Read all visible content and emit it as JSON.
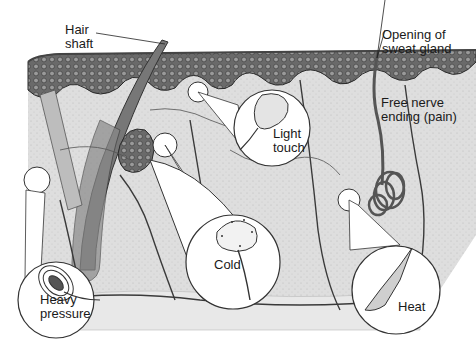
{
  "diagram": {
    "type": "anatomical illustration",
    "labels": {
      "hair_shaft": "Hair\nshaft",
      "sweat_gland": "Opening of\nsweat gland",
      "free_nerve": "Free nerve\nending (pain)",
      "light_touch": "Light\ntouch",
      "cold": "Cold",
      "heavy_pressure": "Heavy\npressure",
      "heat": "Heat"
    },
    "colors": {
      "background": "#ffffff",
      "dermis": "#d9d9d9",
      "epidermis": "#5a5a5a",
      "line": "#3a3a3a",
      "callout": "#ffffff"
    }
  }
}
